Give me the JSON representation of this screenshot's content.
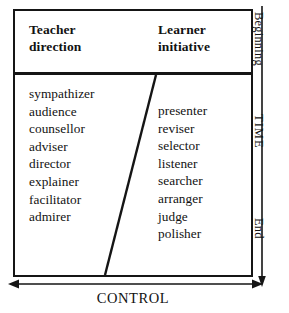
{
  "diagram": {
    "columns": [
      {
        "heading": "Teacher\ndirection",
        "heading_line1": "Teacher",
        "heading_line2": "direction",
        "roles": [
          "sympathizer",
          "audience",
          "counsellor",
          "adviser",
          "director",
          "explainer",
          "facilitator",
          "admirer"
        ]
      },
      {
        "heading": "Learner\ninitiative",
        "heading_line1": "Learner",
        "heading_line2": "initiative",
        "roles": [
          "presenter",
          "reviser",
          "selector",
          "listener",
          "searcher",
          "arranger",
          "judge",
          "polisher"
        ]
      }
    ],
    "vertical_axis": {
      "name": "TIME",
      "top_label": "Beginning",
      "bottom_label": "End",
      "direction": "downward-arrow"
    },
    "horizontal_axis": {
      "name": "CONTROL",
      "direction": "double-headed-arrow"
    },
    "divider": {
      "type": "diagonal-line",
      "description": "slanted boundary separating teacher-directed roles from learner-initiated roles"
    },
    "colors": {
      "ink": "#151515",
      "background": "#ffffff"
    }
  }
}
